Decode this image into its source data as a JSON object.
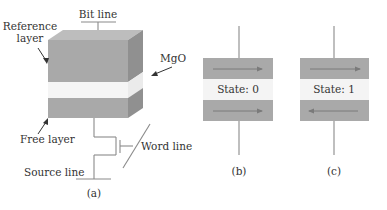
{
  "figure": {
    "panel_a": {
      "caption": "(a)",
      "labels": {
        "bit_line": "Bit line",
        "reference_layer_line1": "Reference",
        "reference_layer_line2": "layer",
        "mgo": "MgO",
        "free_layer": "Free layer",
        "word_line": "Word line",
        "source_line": "Source line"
      }
    },
    "panel_b": {
      "caption": "(b)",
      "state_label": "State: 0",
      "reference_magnetization": "right",
      "free_magnetization": "right"
    },
    "panel_c": {
      "caption": "(c)",
      "state_label": "State: 1",
      "reference_magnetization": "right",
      "free_magnetization": "left"
    },
    "colors": {
      "layer_front": "#a8a8a8",
      "layer_top": "#bcbcbc",
      "layer_side": "#8f8f8f",
      "barrier": "#f4f4f4",
      "arrow": "#7a7a7a",
      "wire": "#8a8a8a",
      "text": "#333333"
    }
  }
}
